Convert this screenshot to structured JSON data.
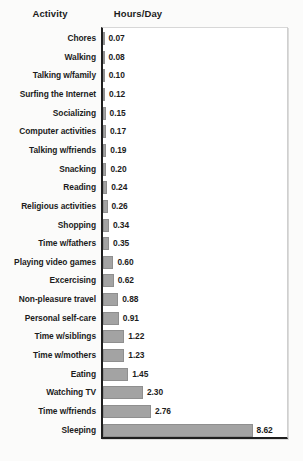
{
  "header": {
    "activity_label": "Activity",
    "hours_label": "Hours/Day"
  },
  "style": {
    "bar_color": "#a3a3a3",
    "bar_border_color": "#8f8f8f",
    "axis_color": "#1e1e1e",
    "text_color": "#1c1c1c",
    "panel_background": "#ffffff",
    "page_background": "#fbfbfa"
  },
  "chart_data": {
    "type": "bar",
    "orientation": "horizontal",
    "title": "",
    "subtitle": "",
    "xlabel": "Hours/Day",
    "ylabel": "Activity",
    "xlim": [
      0,
      10.5
    ],
    "grid": false,
    "legend": null,
    "axis_ticks": [],
    "data_labels": true,
    "categories": [
      "Chores",
      "Walking",
      "Talking w/family",
      "Surfing the Internet",
      "Socializing",
      "Computer activities",
      "Talking w/friends",
      "Snacking",
      "Reading",
      "Religious activities",
      "Shopping",
      "Time w/fathers",
      "Playing video games",
      "Excercising",
      "Non-pleasure travel",
      "Personal self-care",
      "Time w/siblings",
      "Time w/mothers",
      "Eating",
      "Watching TV",
      "Time w/friends",
      "Sleeping"
    ],
    "values": [
      0.07,
      0.08,
      0.1,
      0.12,
      0.15,
      0.17,
      0.19,
      0.2,
      0.24,
      0.26,
      0.34,
      0.35,
      0.6,
      0.62,
      0.88,
      0.91,
      1.22,
      1.23,
      1.45,
      2.3,
      2.76,
      8.62
    ],
    "value_labels": [
      "0.07",
      "0.08",
      "0.10",
      "0.12",
      "0.15",
      "0.17",
      "0.19",
      "0.20",
      "0.24",
      "0.26",
      "0.34",
      "0.35",
      "0.60",
      "0.62",
      "0.88",
      "0.91",
      "1.22",
      "1.23",
      "1.45",
      "2.30",
      "2.76",
      "8.62"
    ]
  }
}
